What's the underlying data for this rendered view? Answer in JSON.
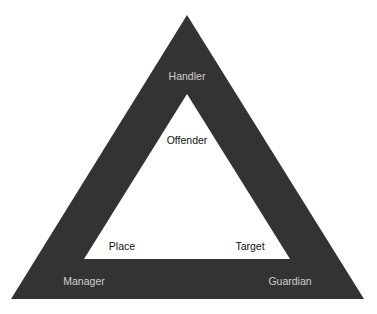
{
  "diagram": {
    "type": "problem-analysis-triangle",
    "colors": {
      "background": "#ffffff",
      "outer_band": "#333333",
      "inner_fill": "#ffffff",
      "outer_label": "#cfcfcf",
      "inner_label": "#111111"
    },
    "outer_triangle": {
      "apex": [
        187,
        15
      ],
      "bottom_left": [
        11,
        299
      ],
      "bottom_right": [
        364,
        299
      ]
    },
    "inner_triangle": {
      "apex": [
        187,
        94
      ],
      "bottom_left": [
        84,
        259
      ],
      "bottom_right": [
        290,
        259
      ]
    },
    "outer_labels": {
      "top": "Handler",
      "bottom_left": "Manager",
      "bottom_right": "Guardian"
    },
    "inner_labels": {
      "top": "Offender",
      "bottom_left": "Place",
      "bottom_right": "Target"
    }
  }
}
